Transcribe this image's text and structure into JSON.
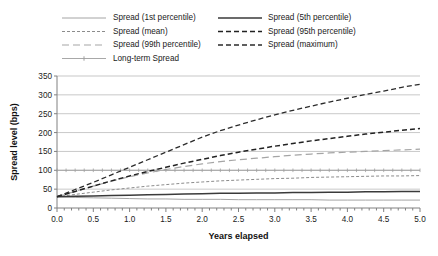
{
  "chart_data": {
    "type": "line",
    "title": "",
    "xlabel": "Years elapsed",
    "ylabel": "Spread level (bps)",
    "xlim": [
      0.0,
      5.0
    ],
    "ylim": [
      0,
      350
    ],
    "xticks": [
      0.0,
      0.5,
      1.0,
      1.5,
      2.0,
      2.5,
      3.0,
      3.5,
      4.0,
      4.5,
      5.0
    ],
    "xticklabels": [
      "0.0",
      "0.5",
      "1.0",
      "1.5",
      "2.0",
      "2.5",
      "3.0",
      "3.5",
      "4.0",
      "4.5",
      "5.0"
    ],
    "yticks": [
      0,
      50,
      100,
      150,
      200,
      250,
      300,
      350
    ],
    "yticklabels": [
      "0",
      "50",
      "100",
      "150",
      "200",
      "250",
      "300",
      "350"
    ],
    "x_minor_tick_step": 0.1,
    "grid": "horizontal",
    "legend_position": "above-plot",
    "x": [
      0.0,
      0.25,
      0.5,
      0.75,
      1.0,
      1.25,
      1.5,
      1.75,
      2.0,
      2.25,
      2.5,
      2.75,
      3.0,
      3.25,
      3.5,
      3.75,
      4.0,
      4.25,
      4.5,
      4.75,
      5.0
    ],
    "series": [
      {
        "name": "Spread (1st percentile)",
        "values": [
          30,
          28,
          27,
          26,
          25,
          24,
          24,
          23,
          23,
          23,
          22,
          22,
          22,
          22,
          22,
          21,
          21,
          21,
          21,
          21,
          21
        ],
        "color": "#9a9a9a",
        "dash": "none",
        "width": 0.9,
        "marker": "none"
      },
      {
        "name": "Spread (mean)",
        "values": [
          30,
          36,
          42,
          48,
          53,
          58,
          62,
          66,
          69,
          72,
          74,
          76,
          78,
          79,
          81,
          82,
          83,
          84,
          85,
          85,
          86
        ],
        "color": "#8c8c8c",
        "dash": "3,2",
        "width": 1.0,
        "marker": "none"
      },
      {
        "name": "Spread (99th percentile)",
        "values": [
          30,
          44,
          58,
          71,
          83,
          93,
          102,
          110,
          117,
          123,
          128,
          132,
          136,
          140,
          143,
          146,
          148,
          150,
          152,
          154,
          156
        ],
        "color": "#a5a5a5",
        "dash": "7,4",
        "width": 1.2,
        "marker": "none"
      },
      {
        "name": "Long-term Spread",
        "values": [
          100,
          100,
          100,
          100,
          100,
          100,
          100,
          100,
          100,
          100,
          100,
          100,
          100,
          100,
          100,
          100,
          100,
          100,
          100,
          100,
          100
        ],
        "color": "#9e9e9e",
        "dash": "none",
        "width": 0.9,
        "marker": "cross"
      },
      {
        "name": "Spread (5th percentile)",
        "values": [
          30,
          31,
          32,
          33,
          34,
          35,
          36,
          37,
          38,
          39,
          39,
          40,
          40,
          41,
          41,
          42,
          42,
          43,
          43,
          44,
          44
        ],
        "color": "#3a3a3a",
        "dash": "none",
        "width": 1.5,
        "marker": "none"
      },
      {
        "name": "Spread (95th percentile)",
        "values": [
          30,
          44,
          58,
          72,
          85,
          97,
          108,
          119,
          129,
          139,
          148,
          156,
          164,
          171,
          178,
          184,
          190,
          196,
          201,
          206,
          211
        ],
        "color": "#222222",
        "dash": "5,3",
        "width": 1.5,
        "marker": "none"
      },
      {
        "name": "Spread (maximum)",
        "values": [
          30,
          49,
          68,
          88,
          108,
          128,
          148,
          168,
          188,
          205,
          220,
          234,
          247,
          259,
          270,
          281,
          291,
          301,
          310,
          320,
          328
        ],
        "color": "#2b2b2b",
        "dash": "5,3",
        "width": 1.3,
        "marker": "none"
      }
    ],
    "legend": {
      "columns": 2,
      "column_1": [
        {
          "label": "Spread (1st percentile)",
          "series_index": 0
        },
        {
          "label": "Spread (mean)",
          "series_index": 1
        },
        {
          "label": "Spread (99th percentile)",
          "series_index": 2
        },
        {
          "label": "Long-term Spread",
          "series_index": 3
        }
      ],
      "column_2": [
        {
          "label": "Spread (5th percentile)",
          "series_index": 4
        },
        {
          "label": "Spread (95th percentile)",
          "series_index": 5
        },
        {
          "label": "Spread (maximum)",
          "series_index": 6
        }
      ]
    },
    "colors": {
      "axis": "#808080",
      "grid": "#b0b0b0",
      "text": "#1a1a1a",
      "background": "#ffffff"
    }
  }
}
